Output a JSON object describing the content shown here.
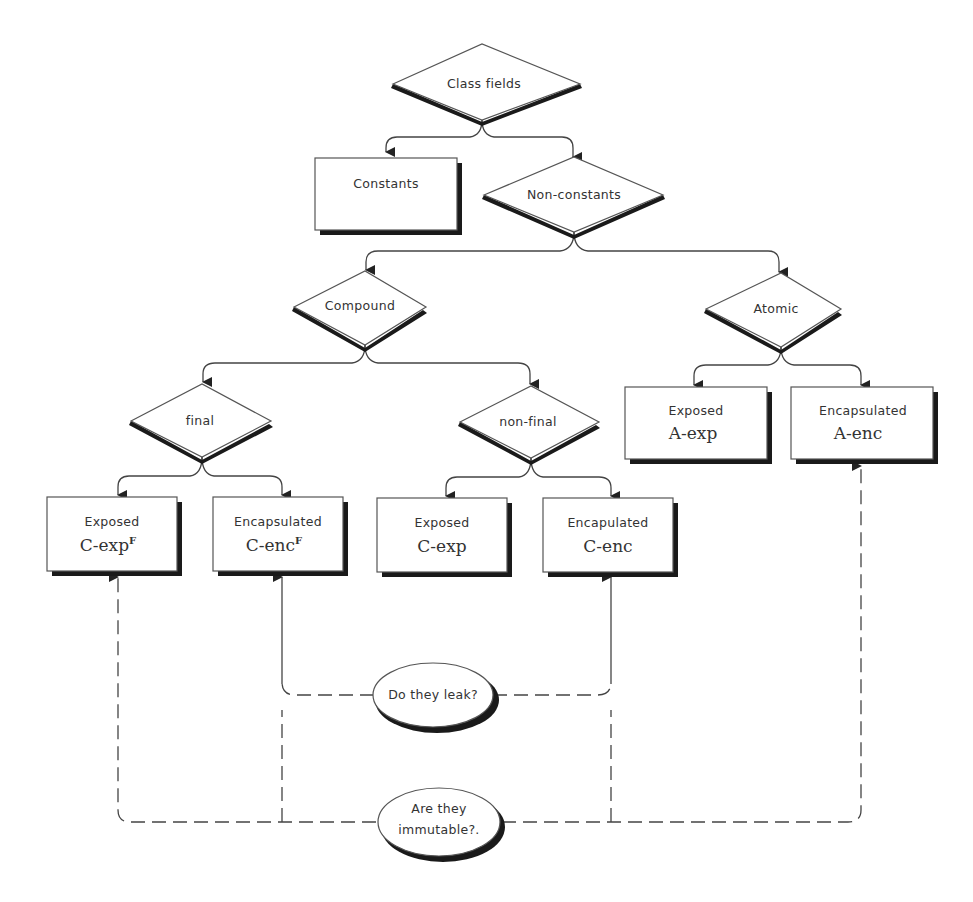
{
  "diagram": {
    "root": {
      "label": "Class fields"
    },
    "constants": {
      "label": "Constants"
    },
    "non_constants": {
      "label": "Non-constants"
    },
    "compound": {
      "label": "Compound"
    },
    "atomic": {
      "label": "Atomic"
    },
    "final": {
      "label": "final"
    },
    "non_final": {
      "label": "non-final"
    },
    "leaves": [
      {
        "title": "Exposed",
        "code": "C-exp",
        "sup": "F"
      },
      {
        "title": "Encapsulated",
        "code": "C-enc",
        "sup": "F"
      },
      {
        "title": "Exposed",
        "code": "C-exp",
        "sup": ""
      },
      {
        "title": "Encapulated",
        "code": "C-enc",
        "sup": ""
      },
      {
        "title": "Exposed",
        "code": "A-exp",
        "sup": ""
      },
      {
        "title": "Encapsulated",
        "code": "A-enc",
        "sup": ""
      }
    ],
    "question_leak": {
      "label": "Do they leak?"
    },
    "question_immutable": {
      "line1": "Are they",
      "line2": "immutable?."
    }
  },
  "colors": {
    "stroke": "#444444",
    "shadow": "#1a1a1a",
    "fill": "#ffffff",
    "text": "#333333"
  }
}
